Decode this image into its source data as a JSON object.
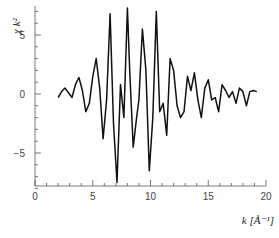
{
  "chart_data": {
    "type": "line",
    "title": "",
    "xlabel": "k [Å⁻¹]",
    "ylabel": "χ k²",
    "xlim": [
      0,
      20
    ],
    "ylim": [
      -9,
      7.5
    ],
    "xticks": [
      0,
      5,
      10,
      15,
      20
    ],
    "yticks": [
      -5,
      0,
      5
    ],
    "grid": false,
    "series": [
      {
        "name": "chi_k2",
        "x": [
          2.0,
          2.3,
          2.6,
          2.9,
          3.2,
          3.5,
          3.8,
          4.1,
          4.4,
          4.7,
          5.0,
          5.3,
          5.6,
          5.9,
          6.2,
          6.5,
          6.8,
          7.1,
          7.4,
          7.7,
          8.0,
          8.2,
          8.5,
          8.8,
          9.0,
          9.3,
          9.6,
          9.9,
          10.2,
          10.5,
          10.8,
          11.1,
          11.4,
          11.7,
          12.0,
          12.3,
          12.6,
          12.9,
          13.2,
          13.5,
          13.8,
          14.1,
          14.4,
          14.7,
          15.0,
          15.3,
          15.6,
          15.9,
          16.2,
          16.5,
          16.8,
          17.1,
          17.4,
          17.7,
          18.0,
          18.3,
          18.6,
          18.9,
          19.2
        ],
        "y": [
          -0.3,
          0.2,
          0.5,
          0.1,
          -0.3,
          0.8,
          1.4,
          0.3,
          -1.5,
          -0.8,
          1.5,
          3.0,
          0.5,
          -3.8,
          -0.5,
          6.8,
          -2.5,
          -7.5,
          0.8,
          -2.0,
          7.3,
          2.0,
          -4.5,
          -2.0,
          -0.5,
          5.5,
          2.0,
          -6.5,
          -2.0,
          7.0,
          -1.5,
          -0.8,
          -3.5,
          3.0,
          2.0,
          -1.0,
          -2.0,
          -1.5,
          1.5,
          0.3,
          1.8,
          -0.5,
          -2.0,
          0.5,
          1.2,
          -0.5,
          -0.3,
          -1.5,
          0.8,
          0.3,
          -0.3,
          0.2,
          -0.8,
          0.5,
          0.2,
          -1.0,
          0.2,
          0.3,
          0.2
        ]
      }
    ]
  }
}
